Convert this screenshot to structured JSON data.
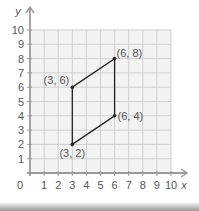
{
  "chart_data": {
    "type": "scatter",
    "title": "",
    "xlabel": "x",
    "ylabel": "y",
    "xlim": [
      0,
      10
    ],
    "ylim": [
      0,
      10
    ],
    "grid": true,
    "origin_label": "0",
    "x_ticks": [
      "1",
      "2",
      "3",
      "4",
      "5",
      "6",
      "7",
      "8",
      "9",
      "10"
    ],
    "y_ticks": [
      "1",
      "2",
      "3",
      "4",
      "5",
      "6",
      "7",
      "8",
      "9",
      "10"
    ],
    "shape": "parallelogram",
    "points": [
      {
        "x": 3,
        "y": 2,
        "label": "(3, 2)"
      },
      {
        "x": 6,
        "y": 4,
        "label": "(6, 4)"
      },
      {
        "x": 6,
        "y": 8,
        "label": "(6, 8)"
      },
      {
        "x": 3,
        "y": 6,
        "label": "(3, 6)"
      }
    ]
  },
  "colors": {
    "grid": "#cfcfcf",
    "grid_bg": "#f3f3f3",
    "axis": "#9a9a9a",
    "shape": "#222222",
    "text": "#555555"
  }
}
